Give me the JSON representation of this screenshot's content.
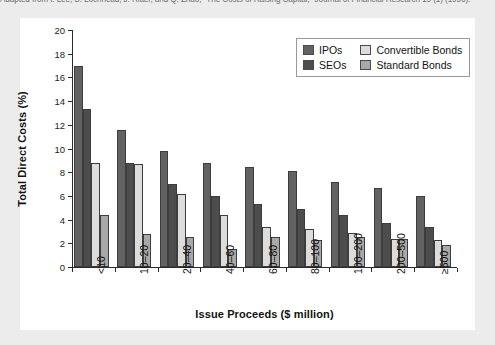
{
  "source_credit": "Adapted from I. Lee, S. Lochhead, J. Ritter, and Q. Zhao, \"The Costs of Raising Capital,\" Journal of Financial Research 19 (1) (1996).",
  "colors": {
    "page_background": "#ececed",
    "panel_background": "#ffffff",
    "axis": "#2b2b2b",
    "series_ipos": "#626262",
    "series_seos": "#4d4d4d",
    "series_convertible_bonds": "#dcdcdc",
    "series_standard_bonds": "#a8a8a8",
    "legend_border": "#9a9a9a"
  },
  "legend": {
    "position": "top-right-inside",
    "entries": [
      {
        "label": "IPOs",
        "color": "#626262"
      },
      {
        "label": "Convertible Bonds",
        "color": "#dcdcdc"
      },
      {
        "label": "SEOs",
        "color": "#4d4d4d"
      },
      {
        "label": "Standard Bonds",
        "color": "#a8a8a8"
      }
    ]
  },
  "chart_data": {
    "type": "bar",
    "title": "",
    "xlabel": "Issue Proceeds ($ million)",
    "ylabel": "Total Direct Costs (%)",
    "categories": [
      "<10",
      "10–20",
      "20–40",
      "40–60",
      "60–80",
      "80–100",
      "100–200",
      "200–500",
      "≥500"
    ],
    "ylim": [
      0,
      20
    ],
    "yticks": [
      0,
      2,
      4,
      6,
      8,
      10,
      12,
      14,
      16,
      18,
      20
    ],
    "ytick_labels": [
      "0",
      "2",
      "4",
      "6",
      "8",
      "10",
      "12",
      "14",
      "16",
      "18",
      "20"
    ],
    "grid": false,
    "series": [
      {
        "name": "IPOs",
        "color": "#626262",
        "values": [
          17.0,
          11.6,
          9.8,
          8.8,
          8.4,
          8.1,
          7.2,
          6.7,
          6.0
        ]
      },
      {
        "name": "SEOs",
        "color": "#4d4d4d",
        "values": [
          13.3,
          8.8,
          7.0,
          6.0,
          5.3,
          4.9,
          4.4,
          3.7,
          3.4
        ]
      },
      {
        "name": "Convertible Bonds",
        "color": "#dcdcdc",
        "values": [
          8.8,
          8.7,
          6.2,
          4.4,
          3.4,
          3.2,
          2.9,
          2.4,
          2.3
        ]
      },
      {
        "name": "Standard Bonds",
        "color": "#a8a8a8",
        "values": [
          4.4,
          2.8,
          2.5,
          1.5,
          2.5,
          2.3,
          2.5,
          2.4,
          1.9
        ]
      }
    ]
  }
}
